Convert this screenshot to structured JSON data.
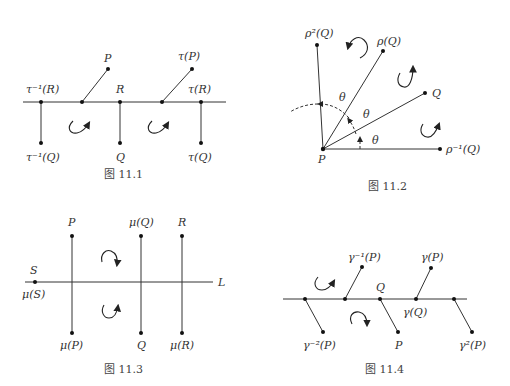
{
  "figures": [
    {
      "caption": "图 11.1",
      "labels": {
        "p": "P",
        "tau_p": "τ(P)",
        "tau_inv_r": "τ⁻¹(R)",
        "r": "R",
        "tau_r": "τ(R)",
        "tau_inv_q": "τ⁻¹(Q)",
        "q": "Q",
        "tau_q": "τ(Q)"
      }
    },
    {
      "caption": "图 11.2",
      "labels": {
        "rho2_q": "ρ²(Q)",
        "rho_q": "ρ(Q)",
        "q": "Q",
        "rho_inv_q": "ρ⁻¹(Q)",
        "p": "P",
        "theta1": "θ",
        "theta2": "θ",
        "theta3": "θ"
      }
    },
    {
      "caption": "图 11.3",
      "labels": {
        "p": "P",
        "mu_q": "μ(Q)",
        "r": "R",
        "s": "S",
        "mu_s": "μ(S)",
        "l": "L",
        "mu_p": "μ(P)",
        "q": "Q",
        "mu_r": "μ(R)"
      }
    },
    {
      "caption": "图 11.4",
      "labels": {
        "gamma_inv_p": "γ⁻¹(P)",
        "gamma_p": "γ(P)",
        "q": "Q",
        "gamma_q": "γ(Q)",
        "gamma_inv2_p": "γ⁻²(P)",
        "p": "P",
        "gamma2_p": "γ²(P)"
      }
    }
  ]
}
